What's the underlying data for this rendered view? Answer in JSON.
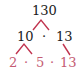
{
  "diagram": {
    "type": "factor-tree",
    "root": "130",
    "level1": [
      "10",
      "13"
    ],
    "level2": [
      "2",
      "5",
      "13"
    ],
    "separator": "·",
    "colors": {
      "text_dark": "#1a1a1a",
      "text_prime": "#c45c73",
      "branch": "#c0344f"
    }
  }
}
